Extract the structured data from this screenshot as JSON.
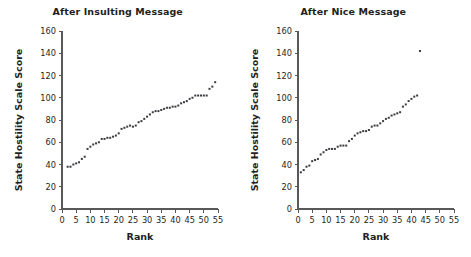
{
  "figure": {
    "background_color": "#ffffff",
    "text_color": "#231f20",
    "axis_color": "#58585b",
    "marker_color": "#3b3b40"
  },
  "chart_data": [
    {
      "type": "scatter",
      "title": "After Insulting Message",
      "xlabel": "Rank",
      "ylabel": "State Hostility Scale Score",
      "xlim": [
        0,
        55
      ],
      "ylim": [
        0,
        160
      ],
      "xticks": [
        0,
        5,
        10,
        15,
        20,
        25,
        30,
        35,
        40,
        45,
        50,
        55
      ],
      "yticks": [
        0,
        20,
        40,
        60,
        80,
        100,
        120,
        140,
        160
      ],
      "grid": false,
      "legend": "none",
      "marker": "square",
      "x": [
        2,
        3,
        4,
        5,
        6,
        7,
        8,
        9,
        10,
        11,
        12,
        13,
        14,
        15,
        16,
        17,
        18,
        19,
        20,
        21,
        22,
        23,
        24,
        25,
        26,
        27,
        28,
        29,
        30,
        31,
        32,
        33,
        34,
        35,
        36,
        37,
        38,
        39,
        40,
        41,
        42,
        43,
        44,
        45,
        46,
        47,
        48,
        49,
        50,
        51,
        52,
        53,
        54
      ],
      "y": [
        38,
        38,
        40,
        41,
        42,
        45,
        47,
        54,
        56,
        58,
        59,
        60,
        63,
        63,
        64,
        64,
        65,
        66,
        68,
        72,
        73,
        74,
        75,
        74,
        75,
        78,
        79,
        81,
        83,
        85,
        87,
        88,
        88,
        89,
        90,
        91,
        91,
        92,
        92,
        93,
        95,
        96,
        97,
        99,
        100,
        102,
        102,
        102,
        102,
        102,
        108,
        110,
        114
      ]
    },
    {
      "type": "scatter",
      "title": "After Nice Message",
      "xlabel": "Rank",
      "ylabel": "State Hostility Scale Score",
      "xlim": [
        0,
        55
      ],
      "ylim": [
        0,
        160
      ],
      "xticks": [
        0,
        5,
        10,
        15,
        20,
        25,
        30,
        35,
        40,
        45,
        50,
        55
      ],
      "yticks": [
        0,
        20,
        40,
        60,
        80,
        100,
        120,
        140,
        160
      ],
      "grid": false,
      "legend": "none",
      "marker": "square",
      "x": [
        1,
        2,
        3,
        4,
        5,
        6,
        7,
        8,
        9,
        10,
        11,
        12,
        13,
        14,
        15,
        16,
        17,
        18,
        19,
        20,
        21,
        22,
        23,
        24,
        25,
        26,
        27,
        28,
        29,
        30,
        31,
        32,
        33,
        34,
        35,
        36,
        37,
        38,
        39,
        40,
        41,
        42,
        43
      ],
      "y": [
        33,
        35,
        38,
        39,
        43,
        44,
        45,
        49,
        51,
        53,
        54,
        54,
        54,
        56,
        57,
        57,
        57,
        61,
        63,
        66,
        68,
        69,
        70,
        70,
        71,
        74,
        75,
        75,
        77,
        79,
        81,
        82,
        84,
        85,
        86,
        87,
        92,
        94,
        97,
        99,
        101,
        102,
        142
      ]
    }
  ],
  "panels": [
    {
      "id": "insulting",
      "title": "After Insulting Message",
      "x_axis_title": "Rank",
      "y_axis_title": "State Hostility Scale Score",
      "x_tick_labels": [
        "0",
        "5",
        "10",
        "15",
        "20",
        "25",
        "30",
        "35",
        "40",
        "45",
        "50",
        "55"
      ],
      "y_tick_labels": [
        "0",
        "20",
        "40",
        "60",
        "80",
        "100",
        "120",
        "140",
        "160"
      ]
    },
    {
      "id": "nice",
      "title": "After Nice Message",
      "x_axis_title": "Rank",
      "y_axis_title": "State Hostility Scale Score",
      "x_tick_labels": [
        "0",
        "5",
        "10",
        "15",
        "20",
        "25",
        "30",
        "35",
        "40",
        "45",
        "50",
        "55"
      ],
      "y_tick_labels": [
        "0",
        "20",
        "40",
        "60",
        "80",
        "100",
        "120",
        "140",
        "160"
      ]
    }
  ]
}
